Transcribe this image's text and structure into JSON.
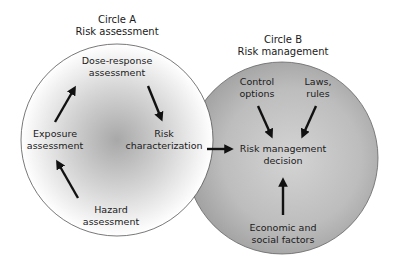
{
  "circle_a": {
    "title_line1": "Circle A",
    "title_line2": "Risk assessment",
    "nodes": {
      "dose_response": [
        "Dose-response",
        "assessment"
      ],
      "exposure": [
        "Exposure",
        "assessment"
      ],
      "risk_char": [
        "Risk",
        "characterization"
      ],
      "hazard": [
        "Hazard",
        "assessment"
      ]
    }
  },
  "circle_b": {
    "title_line1": "Circle B",
    "title_line2": "Risk management",
    "nodes": {
      "control": [
        "Control",
        "options"
      ],
      "laws": [
        "Laws,",
        "rules"
      ],
      "decision": [
        "Risk management",
        "decision"
      ],
      "economic": [
        "Economic and",
        "social factors"
      ]
    }
  },
  "colors": {
    "circle_a_center": "#a8a8a8",
    "circle_a_edge": "#ffffff",
    "circle_b_light": "#d2d2d2",
    "circle_b_dark": "#9a9a9a",
    "outline": "#555555",
    "arrow": "#111111"
  }
}
